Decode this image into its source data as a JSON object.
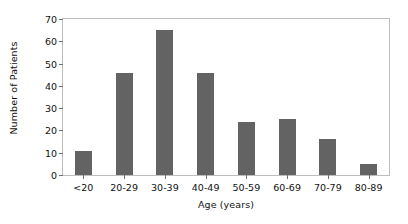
{
  "chart_data": {
    "type": "bar",
    "title": "",
    "xlabel": "Age (years)",
    "ylabel": "Number of Patients",
    "categories": [
      "<20",
      "20-29",
      "30-39",
      "40-49",
      "50-59",
      "60-69",
      "70-79",
      "80-89"
    ],
    "values": [
      11,
      46,
      65,
      46,
      24,
      25,
      16,
      5
    ],
    "ylim": [
      0,
      70
    ],
    "yticks": [
      0,
      10,
      20,
      30,
      40,
      50,
      60,
      70
    ],
    "ytick_labels": [
      "0",
      "10",
      "20",
      "30",
      "40",
      "50",
      "60",
      "70"
    ],
    "grid": false,
    "legend": null,
    "bar_color": "#636363",
    "frame_color": "#bdbdbd",
    "background": "#ffffff"
  }
}
